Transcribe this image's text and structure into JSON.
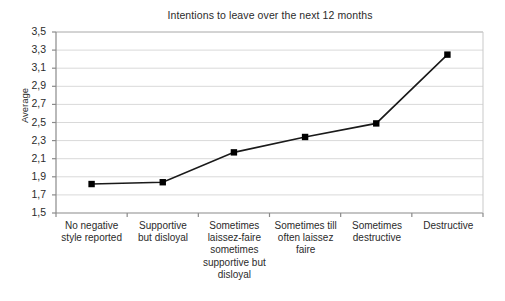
{
  "chart_data": {
    "type": "line",
    "title": "Intentions to leave over the next 12 months",
    "xlabel": "",
    "ylabel": "Average",
    "ylim": [
      1.5,
      3.5
    ],
    "ytick_step": 0.2,
    "decimal_separator": ",",
    "grid": true,
    "legend": "none",
    "marker": "square",
    "line_color": "#1a1a1a",
    "marker_color": "#000000",
    "grid_color": "#d9d9d9",
    "axis_color": "#808080",
    "categories": [
      "No negative style reported",
      "Supportive but disloyal",
      "Sometimes laissez-faire sometimes supportive but disloyal",
      "Sometimes till often laissez faire",
      "Sometimes destructive",
      "Destructive"
    ],
    "category_lines": [
      [
        "No negative",
        "style reported"
      ],
      [
        "Supportive",
        "but disloyal"
      ],
      [
        "Sometimes",
        "laissez-faire",
        "sometimes",
        "supportive but",
        "disloyal"
      ],
      [
        "Sometimes till",
        "often laissez",
        "faire"
      ],
      [
        "Sometimes",
        "destructive"
      ],
      [
        "Destructive"
      ]
    ],
    "values": [
      1.82,
      1.84,
      2.17,
      2.34,
      2.49,
      3.25
    ],
    "ytick_labels": [
      "3,5",
      "3,3",
      "3,1",
      "2,9",
      "2,7",
      "2,5",
      "2,3",
      "2,1",
      "1,9",
      "1,7",
      "1,5"
    ],
    "ytick_values": [
      3.5,
      3.3,
      3.1,
      2.9,
      2.7,
      2.5,
      2.3,
      2.1,
      1.9,
      1.7,
      1.5
    ]
  }
}
